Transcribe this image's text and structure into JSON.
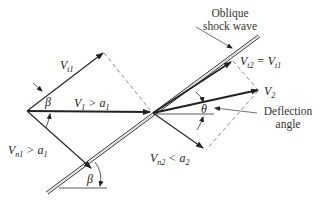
{
  "diagram": {
    "labels": {
      "shock": {
        "line1": "Oblique",
        "line2": "shock wave"
      },
      "vt1": {
        "main": "V",
        "sub": "t1"
      },
      "v1": {
        "main": "V",
        "sub": "1",
        "rel": " > a",
        "rel_sub": "1"
      },
      "vn1": {
        "main": "V",
        "sub": "n1",
        "rel": " > a",
        "rel_sub": "1"
      },
      "beta_top": "β",
      "beta_bottom": "β",
      "vt2": {
        "main": "V",
        "sub": "t2",
        "eq": " = V",
        "eq_sub": "t1"
      },
      "v2": {
        "main": "V",
        "sub": "2"
      },
      "theta": "θ",
      "deflection": {
        "line1": "Deflection",
        "line2": "angle"
      },
      "vn2": {
        "main": "V",
        "sub": "n2",
        "rel": " < a",
        "rel_sub": "2"
      }
    },
    "colors": {
      "ink": "#222222",
      "dash": "#555555"
    }
  }
}
